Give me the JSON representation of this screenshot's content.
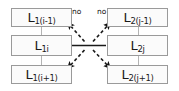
{
  "figure": {
    "type": "diagram",
    "title": "",
    "background_color": "#ffffff",
    "box_border_color": "#9a9a9a",
    "box_fill_color": "#fbfbfb",
    "arrow_color": "#111111",
    "solid_line_color": "#1a1a1a",
    "connector_color": "#b4b4b4"
  },
  "nodes": {
    "left_column": [
      {
        "id": "L1i-1",
        "base": "L",
        "sub": "1(i-1)",
        "text": "L 1(i-1)"
      },
      {
        "id": "L1i",
        "base": "L",
        "sub": "1i",
        "text": "L 1i"
      },
      {
        "id": "L1i+1",
        "base": "L",
        "sub": "1(i+1)",
        "text": "L 1(i+1)"
      }
    ],
    "right_column": [
      {
        "id": "L2j-1",
        "base": "L",
        "sub": "2(j-1)",
        "text": "L 2(j-1)"
      },
      {
        "id": "L2j",
        "base": "L",
        "sub": "2j",
        "text": "L 2j"
      },
      {
        "id": "L2j+1",
        "base": "L",
        "sub": "2(j+1)",
        "text": "L 2(j+1)"
      }
    ]
  },
  "edge_labels": {
    "left_no": "no",
    "right_no": "no"
  },
  "edges": [
    {
      "from": "L1i",
      "to": "L2j",
      "style": "solid",
      "arrow": "none"
    },
    {
      "from": "center",
      "to": "L1i-1",
      "style": "dashed",
      "arrow": "end",
      "label": "no"
    },
    {
      "from": "center",
      "to": "L2j-1",
      "style": "dashed",
      "arrow": "end",
      "label": "no"
    },
    {
      "from": "center",
      "to": "L1i+1",
      "style": "dashed",
      "arrow": "end",
      "label": ""
    },
    {
      "from": "center",
      "to": "L2j+1",
      "style": "dashed",
      "arrow": "end",
      "label": ""
    }
  ]
}
